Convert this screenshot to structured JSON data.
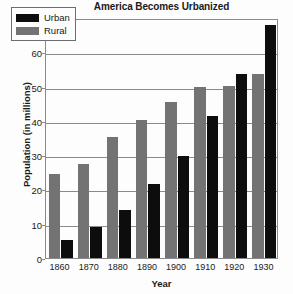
{
  "chart_data": {
    "type": "bar",
    "title": "America Becomes Urbanized",
    "xlabel": "Year",
    "ylabel": "Population (in millions)",
    "categories": [
      "1860",
      "1870",
      "1880",
      "1890",
      "1900",
      "1910",
      "1920",
      "1930"
    ],
    "series": [
      {
        "name": "Urban",
        "color": "#0d0d0d",
        "values": [
          5.2,
          9.0,
          14.0,
          21.5,
          29.7,
          41.4,
          53.8,
          68.0
        ]
      },
      {
        "name": "Rural",
        "color": "#737373",
        "values": [
          24.5,
          27.4,
          35.2,
          40.3,
          45.5,
          50.0,
          50.2,
          53.8
        ]
      }
    ],
    "ylim": [
      0,
      70
    ],
    "yticks": [
      0,
      10,
      20,
      30,
      40,
      50,
      60,
      70
    ],
    "ytick_labels": [
      "0",
      "10",
      "20",
      "30",
      "40",
      "50",
      "60",
      "70"
    ],
    "grid": true,
    "legend_position": "top-left"
  }
}
